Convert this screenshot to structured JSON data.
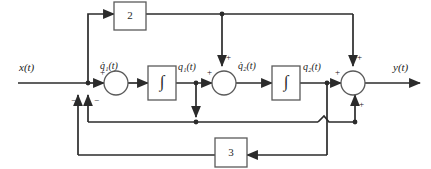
{
  "diagram": {
    "colors": {
      "line": "#2b2b2b",
      "box_stroke": "#5a5a5a",
      "background": "#ffffff",
      "text": "#1a1a1a"
    },
    "signals": {
      "input": "x(t)",
      "output": "y(t)",
      "q1_dot": "q̇₁(t)",
      "q1": "q₁(t)",
      "q2_dot": "q̇₂(t)",
      "q2": "q₂(t)"
    },
    "blocks": [
      {
        "id": "gain-top",
        "label": "2",
        "kind": "gain"
      },
      {
        "id": "integrator-1",
        "label": "∫",
        "kind": "integrator"
      },
      {
        "id": "integrator-2",
        "label": "∫",
        "kind": "integrator"
      },
      {
        "id": "gain-feedback",
        "label": "3",
        "kind": "gain"
      }
    ],
    "summers": [
      {
        "id": "summer-1",
        "signs": [
          {
            "label": "+",
            "position": "left"
          },
          {
            "label": "−",
            "position": "bottom-left"
          },
          {
            "label": "−",
            "position": "bottom-right"
          }
        ]
      },
      {
        "id": "summer-2",
        "signs": [
          {
            "label": "+",
            "position": "left"
          },
          {
            "label": "+",
            "position": "top"
          }
        ]
      },
      {
        "id": "summer-output",
        "signs": [
          {
            "label": "+",
            "position": "left"
          },
          {
            "label": "+",
            "position": "top"
          },
          {
            "label": "+",
            "position": "bottom"
          }
        ]
      }
    ]
  }
}
